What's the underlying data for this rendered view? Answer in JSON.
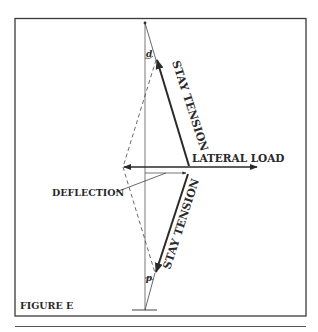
{
  "figure": {
    "caption": "FIGURE E",
    "labels": {
      "upper_stay": "STAY TENSION",
      "lower_stay": "STAY TENSION",
      "lateral_load": "LATERAL LOAD",
      "deflection": "DEFLECTION",
      "angle_top": "d",
      "angle_bottom": "d"
    },
    "colors": {
      "ink": "#2a2a2a",
      "frame": "#3a3a3a",
      "thin": "#555555",
      "background": "#ffffff"
    }
  }
}
